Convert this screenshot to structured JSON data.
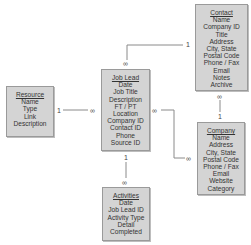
{
  "diagram": {
    "entities": [
      {
        "id": "resource",
        "title": "Resource",
        "fields": [
          "Name",
          "Type",
          "Link",
          "Description"
        ]
      },
      {
        "id": "job_lead",
        "title": "Job Lead",
        "fields": [
          "Date",
          "Job Title",
          "Description",
          "FT / PT",
          "Location",
          "Company ID",
          "Contact ID",
          "Phone",
          "Source ID"
        ]
      },
      {
        "id": "contact",
        "title": "Contact",
        "fields": [
          "Name",
          "Company ID",
          "Title",
          "Address",
          "City, State",
          "Postal Code",
          "Phone / Fax",
          "Email",
          "Notes",
          "Archive"
        ]
      },
      {
        "id": "company",
        "title": "Company",
        "fields": [
          "Name",
          "Address",
          "City, State",
          "Postal Code",
          "Phone / Fax",
          "Email",
          "Website",
          "Category"
        ]
      },
      {
        "id": "activities",
        "title": "Activities",
        "fields": [
          "Date",
          "Job Lead ID",
          "Activity Type",
          "Detail",
          "Completed"
        ]
      }
    ],
    "relationships": [
      {
        "from": "Resource",
        "to": "Job Lead",
        "from_card": "1",
        "to_card": "∞"
      },
      {
        "from": "Contact",
        "to": "Job Lead",
        "from_card": "1",
        "to_card": "∞"
      },
      {
        "from": "Company",
        "to": "Job Lead",
        "from_card": "∞",
        "to_card": "∞",
        "job_lead_side": "∞",
        "company_side": "∞"
      },
      {
        "from": "Company",
        "to": "Contact",
        "from_card": "1",
        "to_card": "∞"
      },
      {
        "from": "Job Lead",
        "to": "Activities",
        "from_card": "1",
        "to_card": "∞"
      }
    ]
  }
}
